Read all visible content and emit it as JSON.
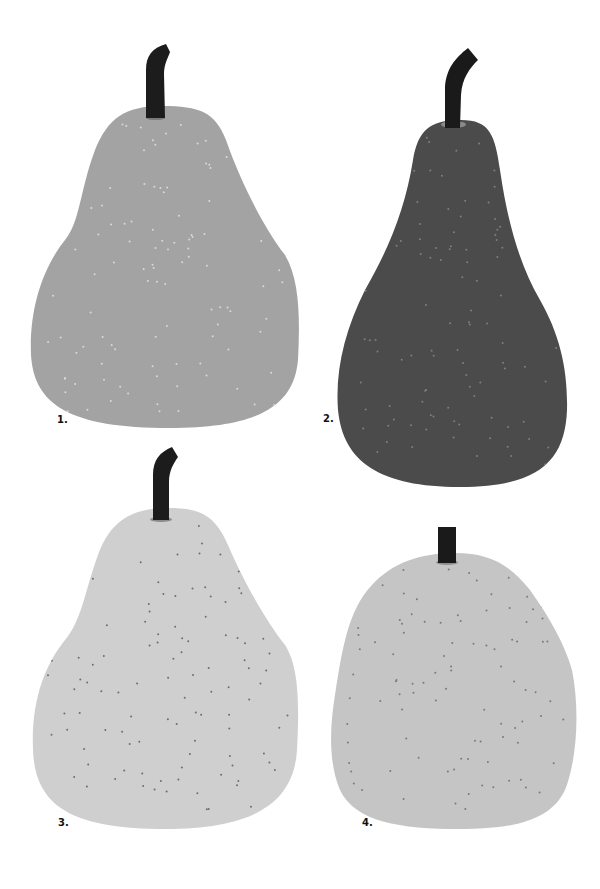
{
  "pears": [
    {
      "label": "1.",
      "label_pos": [
        57,
        414
      ],
      "body_color": "#a3a3a3",
      "dot_color": "#d9d9d9",
      "stem_color": "#1c1c1c",
      "ring_color": "#7a7a7a",
      "body_path": "M162,106 C200,106 215,112 226,140 C240,180 262,225 285,255 C300,280 300,320 298,360 C294,405 260,428 170,428 C70,428 34,405 31,355 C29,305 45,265 65,240 C80,222 80,190 95,150 C108,118 125,106 162,106 Z",
      "stem_path": "M146,118 L146,70 C146,56 152,48 166,44 L170,52 C168,58 164,64 164,74 L165,118 Z",
      "ring": [
        146,
        116,
        165,
        120
      ],
      "dots_bbox": [
        40,
        112,
        295,
        420
      ],
      "dot_count": 120,
      "seed": 7
    },
    {
      "label": "2.",
      "label_pos": [
        323,
        413
      ],
      "body_color": "#4b4b4b",
      "dot_color": "#7f7f7f",
      "stem_color": "#1a1a1a",
      "ring_color": "#8a8a8a",
      "body_path": "M461,120 C490,120 495,135 500,170 C508,225 520,265 540,300 C560,335 568,370 567,410 C565,460 540,487 460,487 C380,487 343,462 338,410 C335,370 345,330 365,290 C388,250 405,210 413,160 C418,130 430,120 461,120 Z",
      "stem_path": "M445,128 L445,90 C445,70 455,58 468,48 L478,60 C470,68 462,78 461,95 L460,128 Z",
      "ring": [
        441,
        121,
        466,
        128
      ],
      "dots_bbox": [
        345,
        128,
        563,
        480
      ],
      "dot_count": 110,
      "seed": 23
    },
    {
      "label": "3.",
      "label_pos": [
        58,
        817
      ],
      "body_color": "#cfcfcf",
      "dot_color": "#6e6e6e",
      "stem_color": "#1c1c1c",
      "ring_color": "#8c8c8c",
      "body_path": "M168,508 C200,508 215,515 228,545 C242,578 265,620 285,645 C300,668 299,710 297,750 C294,800 258,829 165,829 C70,829 35,805 33,750 C31,700 45,665 65,640 C82,620 85,590 98,555 C110,522 130,508 168,508 Z",
      "stem_path": "M153,520 L153,475 C153,460 160,452 172,447 L178,457 C174,463 169,470 169,482 L169,520 Z",
      "ring": [
        150,
        517,
        172,
        522
      ],
      "dots_bbox": [
        42,
        515,
        294,
        818
      ],
      "dot_count": 110,
      "seed": 41
    },
    {
      "label": "4.",
      "label_pos": [
        362,
        817
      ],
      "body_color": "#c5c5c5",
      "dot_color": "#7a7a7a",
      "stem_color": "#1a1a1a",
      "ring_color": "#8f8f8f",
      "body_path": "M455,553 C490,553 510,565 530,590 C550,618 565,645 572,670 C580,710 577,760 565,790 C550,822 510,829 460,829 C400,829 355,822 340,790 C328,762 330,725 335,695 C342,650 348,610 372,585 C392,563 420,553 455,553 Z",
      "stem_path": "M438,563 L438,527 L456,527 L456,563 Z",
      "ring": [
        436,
        560,
        458,
        565
      ],
      "dots_bbox": [
        338,
        560,
        572,
        818
      ],
      "dot_count": 100,
      "seed": 59
    }
  ]
}
